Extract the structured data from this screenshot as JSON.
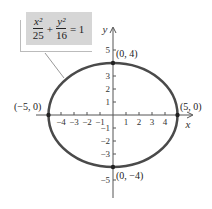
{
  "equation": {
    "x_term_num": "x²",
    "x_term_den": "25",
    "plus": "+",
    "y_term_num": "y²",
    "y_term_den": "16",
    "equals": "= 1"
  },
  "axes": {
    "x_label": "x",
    "y_label": "y",
    "x_ticks": [
      "−4",
      "−3",
      "−2",
      "−1",
      "1",
      "2",
      "3",
      "4"
    ],
    "y_ticks": [
      "5",
      "3",
      "2",
      "1",
      "−1",
      "−2",
      "−3",
      "−5"
    ]
  },
  "points": {
    "top": "(0, 4)",
    "bottom": "(0, −4)",
    "left": "(−5, 0)",
    "right": "(5, 0)"
  },
  "colors": {
    "ellipse": "#4a4a4a",
    "formula_box": "#d6d6d6",
    "axis": "#555555"
  }
}
